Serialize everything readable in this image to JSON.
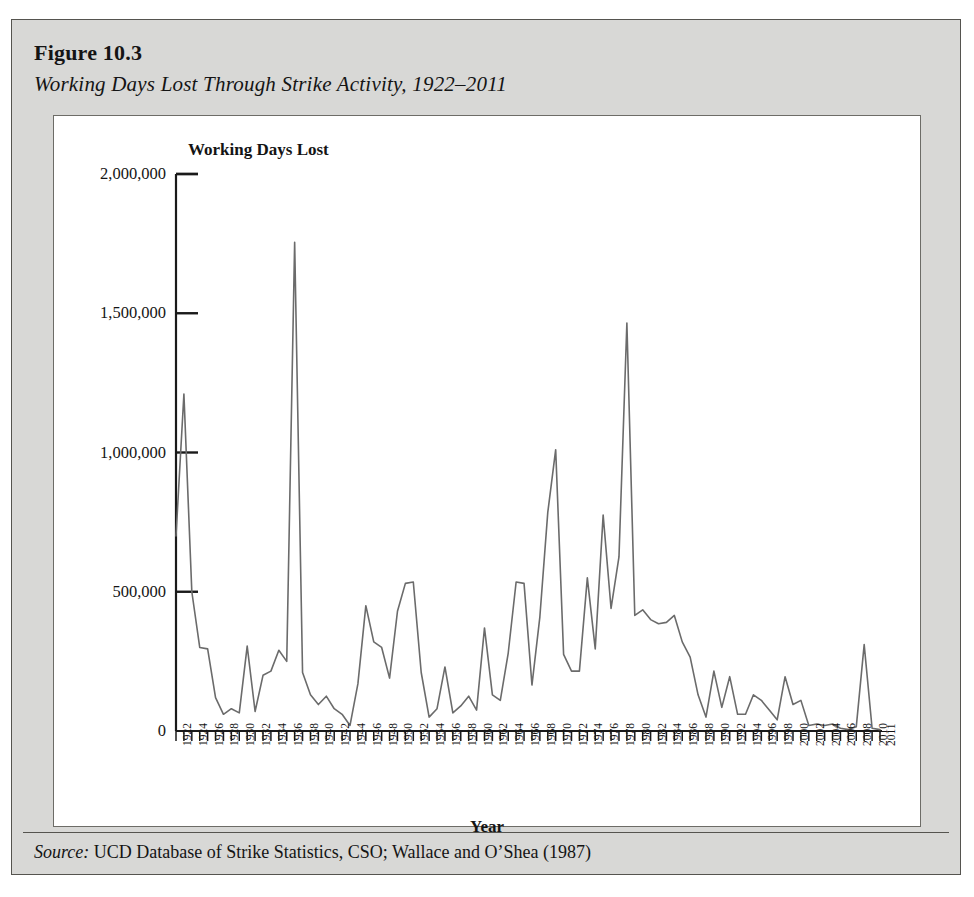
{
  "figure": {
    "number": "Figure 10.3",
    "subtitle": "Working Days Lost Through Strike Activity, 1922–2011",
    "source_label": "Source:",
    "source_text": " UCD Database of Strike Statistics, CSO; Wallace and O’Shea (1987)"
  },
  "colors": {
    "card_background": "#d8d8d6",
    "card_border": "#55544f",
    "plot_background": "#ffffff",
    "plot_border": "#6d6c67",
    "axis": "#1a1a1a",
    "series_line": "#6b6b6b",
    "text": "#141414"
  },
  "chart_data": {
    "type": "line",
    "title": "Working Days Lost Through Strike Activity, 1922–2011",
    "xlabel": "Year",
    "ylabel": "Working Days Lost",
    "ylim": [
      0,
      2000000
    ],
    "xlim": [
      1922,
      2011
    ],
    "grid": false,
    "legend": "none",
    "ytick_labels": [
      "0",
      "500,000",
      "1,000,000",
      "1,500,000",
      "2,000,000"
    ],
    "ytick_values": [
      0,
      500000,
      1000000,
      1500000,
      2000000
    ],
    "xtick_labels": [
      "1922",
      "1924",
      "1926",
      "1928",
      "1930",
      "1932",
      "1934",
      "1936",
      "1938",
      "1940",
      "1942",
      "1944",
      "1946",
      "1948",
      "1950",
      "1952",
      "1954",
      "1956",
      "1958",
      "1960",
      "1962",
      "1964",
      "1966",
      "1968",
      "1970",
      "1972",
      "1974",
      "1976",
      "1978",
      "1980",
      "1982",
      "1984",
      "1986",
      "1988",
      "1990",
      "1992",
      "1994",
      "1996",
      "1998",
      "2000",
      "2002",
      "2004",
      "2006",
      "2008",
      "2010",
      "2011"
    ],
    "xtick_label_rotation": -90,
    "series": [
      {
        "name": "Working Days Lost",
        "x": [
          1922,
          1923,
          1924,
          1925,
          1926,
          1927,
          1928,
          1929,
          1930,
          1931,
          1932,
          1933,
          1934,
          1935,
          1936,
          1937,
          1938,
          1939,
          1940,
          1941,
          1942,
          1943,
          1944,
          1945,
          1946,
          1947,
          1948,
          1949,
          1950,
          1951,
          1952,
          1953,
          1954,
          1955,
          1956,
          1957,
          1958,
          1959,
          1960,
          1961,
          1962,
          1963,
          1964,
          1965,
          1966,
          1967,
          1968,
          1969,
          1970,
          1971,
          1972,
          1973,
          1974,
          1975,
          1976,
          1977,
          1978,
          1979,
          1980,
          1981,
          1982,
          1983,
          1984,
          1985,
          1986,
          1987,
          1988,
          1989,
          1990,
          1991,
          1992,
          1993,
          1994,
          1995,
          1996,
          1997,
          1998,
          1999,
          2000,
          2001,
          2002,
          2003,
          2004,
          2005,
          2006,
          2007,
          2008,
          2009,
          2010,
          2011
        ],
        "values": [
          700000,
          1210000,
          500000,
          300000,
          295000,
          120000,
          60000,
          80000,
          65000,
          305000,
          70000,
          200000,
          215000,
          290000,
          250000,
          1755000,
          210000,
          130000,
          95000,
          125000,
          80000,
          60000,
          20000,
          170000,
          450000,
          320000,
          300000,
          190000,
          430000,
          530000,
          535000,
          210000,
          50000,
          80000,
          230000,
          65000,
          90000,
          125000,
          75000,
          370000,
          130000,
          110000,
          280000,
          535000,
          530000,
          165000,
          410000,
          785000,
          1010000,
          275000,
          215000,
          215000,
          550000,
          295000,
          775000,
          440000,
          625000,
          1465000,
          415000,
          435000,
          400000,
          385000,
          390000,
          415000,
          320000,
          265000,
          130000,
          50000,
          215000,
          85000,
          195000,
          60000,
          60000,
          130000,
          110000,
          75000,
          40000,
          195000,
          95000,
          110000,
          20000,
          25000,
          20000,
          25000,
          10000,
          5000,
          15000,
          310000,
          10000,
          5000
        ]
      }
    ]
  },
  "axes": {
    "y_axis_title": "Working Days Lost",
    "x_axis_title": "Year"
  }
}
